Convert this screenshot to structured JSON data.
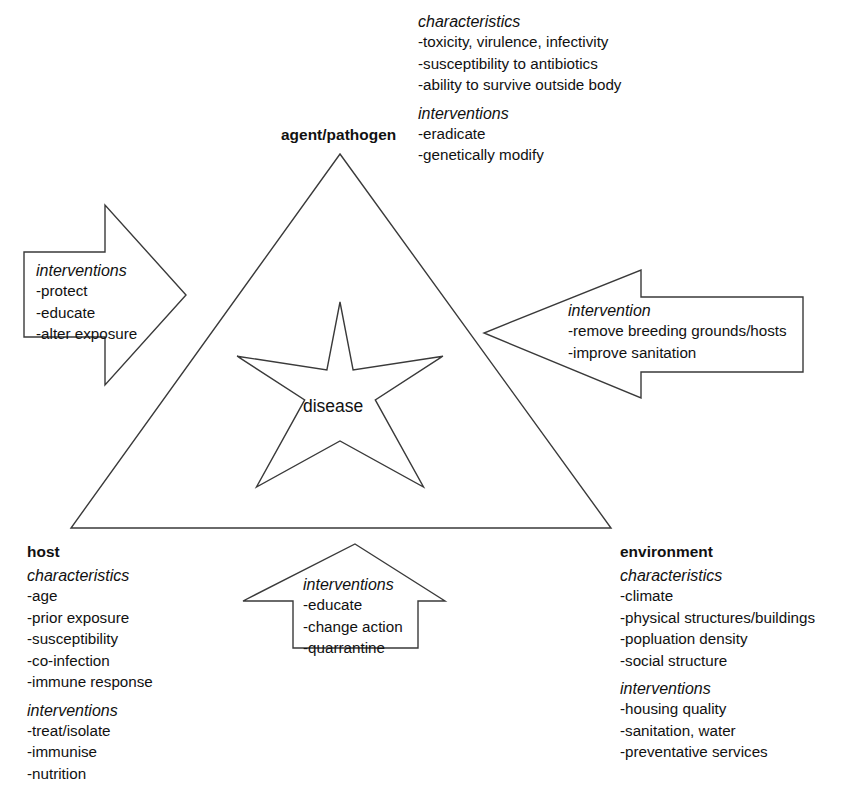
{
  "diagram": {
    "center_label": "disease",
    "vertices": {
      "top": {
        "name": "agent/pathogen",
        "characteristics_label": "characteristics",
        "characteristics": [
          "-toxicity, virulence, infectivity",
          "-susceptibility to antibiotics",
          "-ability to survive outside body"
        ],
        "interventions_label": "interventions",
        "interventions": [
          "-eradicate",
          "-genetically modify"
        ]
      },
      "bottom_left": {
        "name": "host",
        "characteristics_label": "characteristics",
        "characteristics": [
          "-age",
          "-prior exposure",
          "-susceptibility",
          "-co-infection",
          "-immune response"
        ],
        "interventions_label": "interventions",
        "interventions": [
          "-treat/isolate",
          "-immunise",
          "-nutrition"
        ]
      },
      "bottom_right": {
        "name": "environment",
        "characteristics_label": "characteristics",
        "characteristics": [
          "-climate",
          "-physical structures/buildings",
          "-popluation density",
          "-social structure"
        ],
        "interventions_label": "interventions",
        "interventions": [
          "-housing quality",
          "-sanitation, water",
          "-preventative services"
        ]
      }
    },
    "arrows": {
      "left": {
        "label": "interventions",
        "items": [
          "-protect",
          "-educate",
          "-alter exposure"
        ],
        "direction": "right"
      },
      "right": {
        "label": "intervention",
        "items": [
          "-remove breeding grounds/hosts",
          "-improve sanitation"
        ],
        "direction": "left"
      },
      "bottom": {
        "label": "interventions",
        "items": [
          "-educate",
          "-change action",
          "-quarrantine"
        ],
        "direction": "up"
      }
    },
    "colors": {
      "stroke": "#3a3a3a",
      "text": "#111111",
      "background": "#ffffff"
    }
  }
}
